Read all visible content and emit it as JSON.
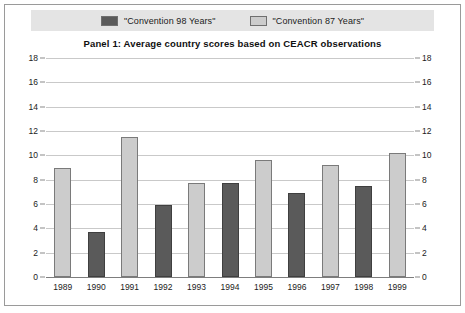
{
  "legend": {
    "entries": [
      {
        "label": "\"Convention 98 Years\"",
        "swatch": "dark",
        "color": "#5a5a5a"
      },
      {
        "label": "\"Convention 87 Years\"",
        "swatch": "light",
        "color": "#cccccc"
      }
    ]
  },
  "chart_data": {
    "type": "bar",
    "title": "Panel 1:   Average country scores based on CEACR observations",
    "xlabel": "",
    "ylabel": "",
    "ylim": [
      0,
      18
    ],
    "ytick_step": 2,
    "yticks": [
      0,
      2,
      4,
      6,
      8,
      10,
      12,
      14,
      16,
      18
    ],
    "grid": true,
    "legend_position": "top",
    "categories": [
      "1989",
      "1990",
      "1991",
      "1992",
      "1993",
      "1994",
      "1995",
      "1996",
      "1997",
      "1998",
      "1999"
    ],
    "values": [
      9.0,
      3.7,
      11.5,
      5.9,
      7.7,
      7.7,
      9.6,
      6.9,
      9.2,
      7.5,
      10.2
    ],
    "bar_series": [
      "Convention 87 Years",
      "Convention 98 Years",
      "Convention 87 Years",
      "Convention 98 Years",
      "Convention 87 Years",
      "Convention 98 Years",
      "Convention 87 Years",
      "Convention 98 Years",
      "Convention 87 Years",
      "Convention 98 Years",
      "Convention 87 Years"
    ],
    "bar_styles": [
      "light",
      "dark",
      "light",
      "dark",
      "light",
      "dark",
      "light",
      "dark",
      "light",
      "dark",
      "light"
    ],
    "series": [
      {
        "name": "\"Convention 98 Years\"",
        "color": "#5a5a5a",
        "points": [
          {
            "x": "1990",
            "y": 3.7
          },
          {
            "x": "1992",
            "y": 5.9
          },
          {
            "x": "1994",
            "y": 7.7
          },
          {
            "x": "1996",
            "y": 6.9
          },
          {
            "x": "1998",
            "y": 7.5
          }
        ]
      },
      {
        "name": "\"Convention 87 Years\"",
        "color": "#cccccc",
        "points": [
          {
            "x": "1989",
            "y": 9.0
          },
          {
            "x": "1991",
            "y": 11.5
          },
          {
            "x": "1993",
            "y": 7.7
          },
          {
            "x": "1995",
            "y": 9.6
          },
          {
            "x": "1997",
            "y": 9.2
          },
          {
            "x": "1999",
            "y": 10.2
          }
        ]
      }
    ]
  }
}
